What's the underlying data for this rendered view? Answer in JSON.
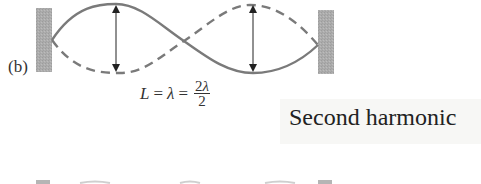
{
  "figure": {
    "part_label": "(b)",
    "equation": {
      "lhs": "L",
      "eq1": "=",
      "mid": "λ",
      "eq2": "=",
      "numerator_coef": "2",
      "numerator_var": "λ",
      "denominator": "2"
    },
    "caption": "Second harmonic",
    "colors": {
      "wall": "#a8a8a8",
      "string": "#7a7a7a",
      "arrow": "#222222",
      "caption_bg": "#f7f7f5"
    },
    "icons": [
      "left-fixed-wall",
      "right-fixed-wall",
      "amplitude-arrow",
      "amplitude-arrow"
    ]
  }
}
